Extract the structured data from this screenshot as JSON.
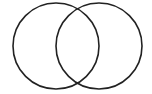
{
  "diagram": {
    "type": "venn",
    "stroke_color": "#222222",
    "background": "#ffffff",
    "circles": [
      {
        "name": "left-set",
        "cx": 56,
        "cy": 46,
        "r": 43
      },
      {
        "name": "right-set",
        "cx": 99,
        "cy": 46,
        "r": 43
      }
    ]
  }
}
